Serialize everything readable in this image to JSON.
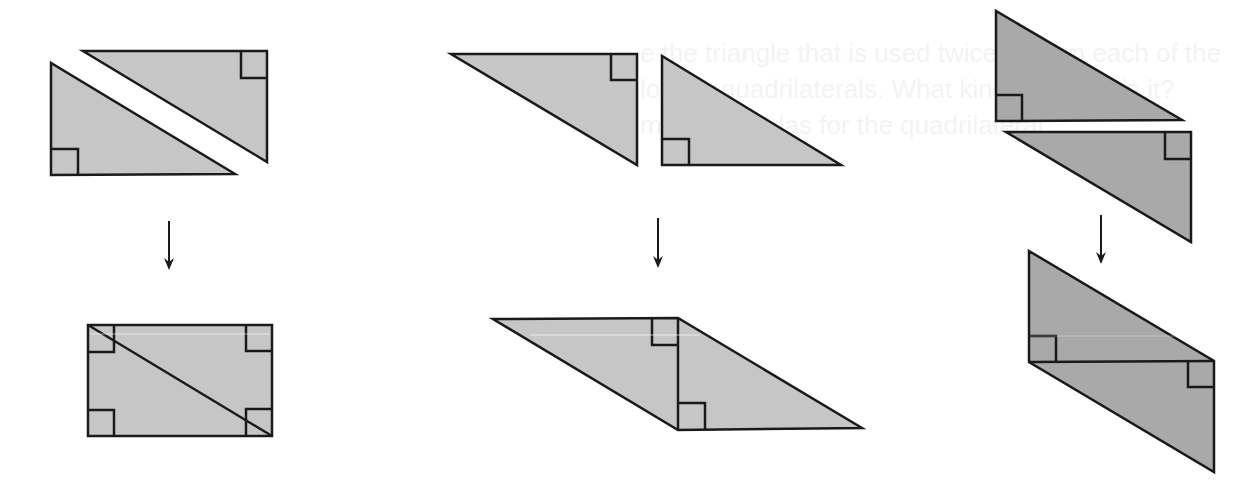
{
  "ghost_text": {
    "line1": "e the triangle that is used twice to form each of the",
    "line2": "lowing quadrilaterals. What kind of shape is it?",
    "line3": "m the formulas for the quadrilateral."
  },
  "colors": {
    "stroke": "#1a1a1a",
    "fill_light": "#c6c6c6",
    "fill_dark": "#a9a9a9",
    "background": "#ffffff"
  },
  "panels": [
    {
      "name": "rectangle-composition",
      "before": "two congruent right triangles separated along hypotenuse",
      "after": "rectangle with diagonal",
      "right_angle_marks_after": 4
    },
    {
      "name": "parallelogram-composition",
      "before": "two congruent right triangles side by side",
      "after": "parallelogram joined at shared vertical leg",
      "right_angle_marks_after": 2
    },
    {
      "name": "parallelogram-vertical-composition",
      "before": "two congruent right triangles stacked",
      "after": "parallelogram joined at shared horizontal leg",
      "right_angle_marks_after": 2
    }
  ]
}
